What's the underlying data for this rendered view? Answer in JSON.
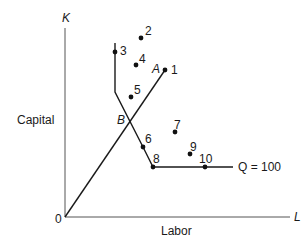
{
  "axes": {
    "y_axis_symbol": "K",
    "y_axis_label": "Capital",
    "x_axis_symbol": "L",
    "x_axis_label": "Labor",
    "origin_label": "0"
  },
  "isoquant": {
    "label": "Q = 100"
  },
  "ray": {
    "points": [
      "A",
      "B"
    ]
  },
  "labels": {
    "A": "A",
    "B": "B"
  },
  "points": [
    {
      "id": "1",
      "label": "1"
    },
    {
      "id": "2",
      "label": "2"
    },
    {
      "id": "3",
      "label": "3"
    },
    {
      "id": "4",
      "label": "4"
    },
    {
      "id": "5",
      "label": "5"
    },
    {
      "id": "6",
      "label": "6"
    },
    {
      "id": "7",
      "label": "7"
    },
    {
      "id": "8",
      "label": "8"
    },
    {
      "id": "9",
      "label": "9"
    },
    {
      "id": "10",
      "label": "10"
    }
  ],
  "colors": {
    "line": "#1a1a1a",
    "axis": "#444444"
  }
}
